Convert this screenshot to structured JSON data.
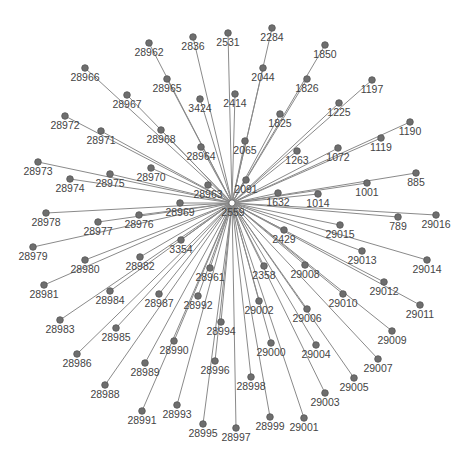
{
  "graph": {
    "type": "star-network",
    "edge_color": "#8a8a8a",
    "node_color": "#6e6e6e",
    "label_color": "#444444",
    "center": {
      "id": "2559",
      "x": 232,
      "y": 203
    },
    "nodes": [
      {
        "id": "28962",
        "x": 149,
        "y": 43
      },
      {
        "id": "2836",
        "x": 193,
        "y": 37
      },
      {
        "id": "2531",
        "x": 228,
        "y": 33
      },
      {
        "id": "2284",
        "x": 272,
        "y": 28
      },
      {
        "id": "1850",
        "x": 325,
        "y": 45
      },
      {
        "id": "28966",
        "x": 85,
        "y": 68
      },
      {
        "id": "28965",
        "x": 167,
        "y": 79
      },
      {
        "id": "2044",
        "x": 263,
        "y": 68
      },
      {
        "id": "1826",
        "x": 307,
        "y": 79
      },
      {
        "id": "1197",
        "x": 372,
        "y": 80
      },
      {
        "id": "28967",
        "x": 127,
        "y": 95
      },
      {
        "id": "3424",
        "x": 200,
        "y": 99
      },
      {
        "id": "2414",
        "x": 235,
        "y": 94
      },
      {
        "id": "1225",
        "x": 339,
        "y": 103
      },
      {
        "id": "1190",
        "x": 410,
        "y": 122
      },
      {
        "id": "28972",
        "x": 65,
        "y": 116
      },
      {
        "id": "28971",
        "x": 101,
        "y": 131
      },
      {
        "id": "28968",
        "x": 161,
        "y": 130
      },
      {
        "id": "1825",
        "x": 280,
        "y": 114
      },
      {
        "id": "2065",
        "x": 245,
        "y": 141
      },
      {
        "id": "28964",
        "x": 201,
        "y": 147
      },
      {
        "id": "1119",
        "x": 381,
        "y": 138
      },
      {
        "id": "1263",
        "x": 297,
        "y": 151
      },
      {
        "id": "1072",
        "x": 338,
        "y": 148
      },
      {
        "id": "28973",
        "x": 38,
        "y": 162
      },
      {
        "id": "28975",
        "x": 110,
        "y": 174
      },
      {
        "id": "28970",
        "x": 151,
        "y": 168
      },
      {
        "id": "28974",
        "x": 70,
        "y": 179
      },
      {
        "id": "2091",
        "x": 246,
        "y": 180
      },
      {
        "id": "28963",
        "x": 208,
        "y": 185
      },
      {
        "id": "885",
        "x": 416,
        "y": 173
      },
      {
        "id": "1001",
        "x": 367,
        "y": 183
      },
      {
        "id": "1632",
        "x": 278,
        "y": 193
      },
      {
        "id": "1014",
        "x": 318,
        "y": 194
      },
      {
        "id": "28969",
        "x": 180,
        "y": 203
      },
      {
        "id": "28978",
        "x": 46,
        "y": 213
      },
      {
        "id": "28977",
        "x": 98,
        "y": 222
      },
      {
        "id": "28976",
        "x": 139,
        "y": 215
      },
      {
        "id": "789",
        "x": 398,
        "y": 217
      },
      {
        "id": "29016",
        "x": 436,
        "y": 215
      },
      {
        "id": "29015",
        "x": 340,
        "y": 225
      },
      {
        "id": "2429",
        "x": 284,
        "y": 230
      },
      {
        "id": "28979",
        "x": 33,
        "y": 247
      },
      {
        "id": "3354",
        "x": 181,
        "y": 240
      },
      {
        "id": "29013",
        "x": 362,
        "y": 251
      },
      {
        "id": "29014",
        "x": 427,
        "y": 260
      },
      {
        "id": "28980",
        "x": 85,
        "y": 260
      },
      {
        "id": "28982",
        "x": 140,
        "y": 257
      },
      {
        "id": "28961",
        "x": 210,
        "y": 268
      },
      {
        "id": "2358",
        "x": 264,
        "y": 266
      },
      {
        "id": "29008",
        "x": 305,
        "y": 265
      },
      {
        "id": "28981",
        "x": 44,
        "y": 285
      },
      {
        "id": "28984",
        "x": 110,
        "y": 291
      },
      {
        "id": "28987",
        "x": 159,
        "y": 294
      },
      {
        "id": "28992",
        "x": 198,
        "y": 296
      },
      {
        "id": "29012",
        "x": 384,
        "y": 282
      },
      {
        "id": "29010",
        "x": 343,
        "y": 294
      },
      {
        "id": "29011",
        "x": 420,
        "y": 305
      },
      {
        "id": "29002",
        "x": 259,
        "y": 301
      },
      {
        "id": "29006",
        "x": 307,
        "y": 309
      },
      {
        "id": "28983",
        "x": 60,
        "y": 320
      },
      {
        "id": "28985",
        "x": 116,
        "y": 328
      },
      {
        "id": "28994",
        "x": 221,
        "y": 322
      },
      {
        "id": "29000",
        "x": 271,
        "y": 343
      },
      {
        "id": "28990",
        "x": 174,
        "y": 341
      },
      {
        "id": "29004",
        "x": 316,
        "y": 345
      },
      {
        "id": "29009",
        "x": 392,
        "y": 331
      },
      {
        "id": "28986",
        "x": 77,
        "y": 354
      },
      {
        "id": "28996",
        "x": 215,
        "y": 361
      },
      {
        "id": "28989",
        "x": 145,
        "y": 363
      },
      {
        "id": "29007",
        "x": 378,
        "y": 359
      },
      {
        "id": "28998",
        "x": 251,
        "y": 377
      },
      {
        "id": "29005",
        "x": 354,
        "y": 378
      },
      {
        "id": "28988",
        "x": 105,
        "y": 385
      },
      {
        "id": "29003",
        "x": 325,
        "y": 393
      },
      {
        "id": "28993",
        "x": 177,
        "y": 405
      },
      {
        "id": "28991",
        "x": 142,
        "y": 411
      },
      {
        "id": "28999",
        "x": 270,
        "y": 417
      },
      {
        "id": "29001",
        "x": 304,
        "y": 418
      },
      {
        "id": "28995",
        "x": 203,
        "y": 424
      },
      {
        "id": "28997",
        "x": 236,
        "y": 428
      }
    ]
  }
}
